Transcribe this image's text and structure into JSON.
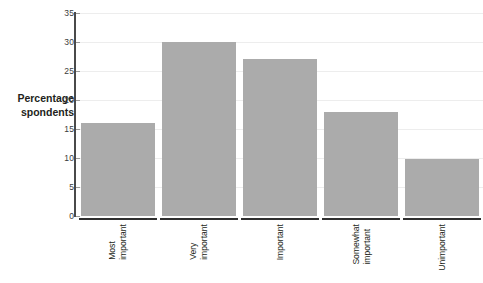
{
  "chart_data": {
    "type": "bar",
    "title": "",
    "subtitle": "",
    "xlabel": "",
    "ylabel_lines": [
      "Percentage",
      "spondents"
    ],
    "ylabel_full": "Percentage of respondents",
    "categories": [
      [
        "Most",
        "important"
      ],
      [
        "Very",
        "important"
      ],
      [
        "Important"
      ],
      [
        "Somewhat",
        "important"
      ],
      [
        "Unimportant"
      ]
    ],
    "category_labels": [
      "Most important",
      "Very important",
      "Important",
      "Somewhat important",
      "Unimportant"
    ],
    "values": [
      16,
      30,
      27,
      18,
      9.8
    ],
    "ylim": [
      0,
      35
    ],
    "yticks": [
      0,
      5,
      10,
      15,
      20,
      25,
      30,
      35
    ],
    "ytick_labels": [
      "0",
      "5",
      "10",
      "15",
      "20",
      "25",
      "30",
      "35"
    ],
    "grid": true,
    "grid_axis": "y",
    "legend": false,
    "legend_position": "none",
    "bar_color": "#ababab",
    "gridline_color": "#ededed",
    "axis_color": "#2f2f2f",
    "background_color": "#ffffff"
  }
}
